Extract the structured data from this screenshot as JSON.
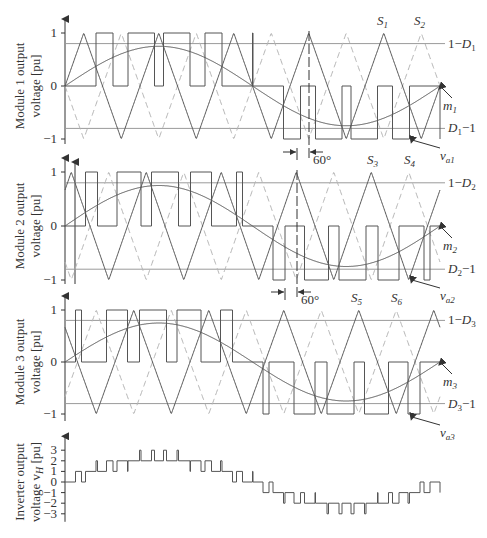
{
  "figure": {
    "width": 487,
    "height": 538,
    "colors": {
      "line": "#555555",
      "ref_line": "#9a9a9a",
      "dashed": "#b5b5b5",
      "text": "#333333"
    }
  },
  "modules": [
    {
      "id": "module-1",
      "ylabel_line1": "Module 1 output",
      "ylabel_line2": "voltage [pu]",
      "tick_labels": [
        "1",
        "0",
        "−1"
      ],
      "upper_ref_label": "1−D",
      "upper_ref_sub": "1",
      "lower_ref_label": "D",
      "lower_ref_sub": "1",
      "lower_ref_suffix": "−1",
      "mod_label": "m",
      "mod_sub": "1",
      "out_label": "v",
      "out_sub": "a1",
      "carrier_labels": [
        {
          "text": "S",
          "sub": "1"
        },
        {
          "text": "S",
          "sub": "2"
        }
      ],
      "phase_shift_label": "60°"
    },
    {
      "id": "module-2",
      "ylabel_line1": "Module 2 output",
      "ylabel_line2": "voltage [pu]",
      "tick_labels": [
        "1",
        "0",
        "−1"
      ],
      "upper_ref_label": "1−D",
      "upper_ref_sub": "2",
      "lower_ref_label": "D",
      "lower_ref_sub": "2",
      "lower_ref_suffix": "−1",
      "mod_label": "m",
      "mod_sub": "2",
      "out_label": "v",
      "out_sub": "a2",
      "carrier_labels": [
        {
          "text": "S",
          "sub": "3"
        },
        {
          "text": "S",
          "sub": "4"
        }
      ],
      "phase_shift_label": "60°"
    },
    {
      "id": "module-3",
      "ylabel_line1": "Module 3 output",
      "ylabel_line2": "voltage [pu]",
      "tick_labels": [
        "1",
        "0",
        "−1"
      ],
      "upper_ref_label": "1−D",
      "upper_ref_sub": "3",
      "lower_ref_label": "D",
      "lower_ref_sub": "3",
      "lower_ref_suffix": "−1",
      "mod_label": "m",
      "mod_sub": "3",
      "out_label": "v",
      "out_sub": "a3",
      "carrier_labels": [
        {
          "text": "S",
          "sub": "5"
        },
        {
          "text": "S",
          "sub": "6"
        }
      ]
    }
  ],
  "inverter": {
    "ylabel_line1": "Inverter output",
    "ylabel_line2": "voltage v",
    "ylabel_sub": "H",
    "ylabel_suffix": " [pu]",
    "tick_labels": [
      "3",
      "2",
      "1",
      "0",
      "−1",
      "−2",
      "−3"
    ],
    "levels": [
      3,
      2,
      1,
      0,
      -1,
      -2,
      -3
    ]
  },
  "chart_data": {
    "type": "line",
    "panels": [
      {
        "name": "Module 1 output voltage [pu]",
        "ylim": [
          -1,
          1
        ],
        "yticks": [
          -1,
          0,
          1
        ],
        "modulation_amplitude": 0.75,
        "carrier_phase_deg": 0,
        "reference_lines": [
          0.8,
          -0.8
        ],
        "carriers": [
          "S1",
          "S2"
        ],
        "signals": [
          "m1",
          "va1"
        ]
      },
      {
        "name": "Module 2 output voltage [pu]",
        "ylim": [
          -1,
          1
        ],
        "yticks": [
          -1,
          0,
          1
        ],
        "modulation_amplitude": 0.75,
        "carrier_phase_deg": 60,
        "reference_lines": [
          0.8,
          -0.8
        ],
        "carriers": [
          "S3",
          "S4"
        ],
        "signals": [
          "m2",
          "va2"
        ]
      },
      {
        "name": "Module 3 output voltage [pu]",
        "ylim": [
          -1,
          1
        ],
        "yticks": [
          -1,
          0,
          1
        ],
        "modulation_amplitude": 0.75,
        "carrier_phase_deg": 120,
        "reference_lines": [
          0.8,
          -0.8
        ],
        "carriers": [
          "S5",
          "S6"
        ],
        "signals": [
          "m3",
          "va3"
        ]
      },
      {
        "name": "Inverter output voltage vH [pu]",
        "ylim": [
          -3,
          3
        ],
        "yticks": [
          -3,
          -2,
          -1,
          0,
          1,
          2,
          3
        ],
        "levels": [
          -3,
          -2,
          -1,
          0,
          1,
          2,
          3
        ]
      }
    ],
    "annotations": [
      "60°",
      "60°"
    ],
    "carrier_periods_per_cycle": 5
  }
}
